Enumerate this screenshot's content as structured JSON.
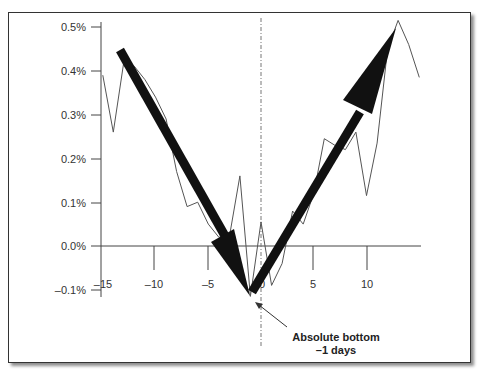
{
  "chart_data": {
    "type": "line",
    "title": "",
    "xlabel": "",
    "ylabel": "",
    "x": [
      -15,
      -14,
      -13,
      -12,
      -11,
      -10,
      -9,
      -8,
      -7,
      -6,
      -5,
      -4,
      -3,
      -2,
      -1,
      0,
      1,
      2,
      3,
      4,
      5,
      6,
      7,
      8,
      9,
      10,
      11,
      12,
      13,
      14,
      15
    ],
    "series": [
      {
        "name": "Return",
        "values": [
          0.39,
          0.26,
          0.42,
          0.41,
          0.38,
          0.34,
          0.29,
          0.17,
          0.09,
          0.1,
          0.05,
          0.02,
          0.02,
          0.16,
          -0.115,
          0.055,
          -0.09,
          -0.04,
          0.08,
          0.05,
          0.12,
          0.245,
          0.23,
          0.22,
          0.26,
          0.115,
          0.235,
          0.45,
          0.515,
          0.46,
          0.385
        ]
      }
    ],
    "xticks": [
      "-15",
      "-10",
      "-5",
      "0",
      "5",
      "10"
    ],
    "yticks": [
      "0.5%",
      "0.4%",
      "0.3%",
      "0.2%",
      "0.1%",
      "0.0%",
      "-0.1%"
    ],
    "ylim": [
      -0.1,
      0.5
    ],
    "xlim": [
      -15,
      15
    ],
    "grid": false,
    "legend": "none",
    "annotations": [
      {
        "text": "Absolute bottom",
        "line2": "–1 days",
        "x": -1,
        "y": -0.115
      },
      {
        "type": "trend-arrow",
        "from": [
          -13.5,
          0.455
        ],
        "to": [
          -1,
          -0.115
        ]
      },
      {
        "type": "trend-arrow",
        "from": [
          -1,
          -0.115
        ],
        "to": [
          12.5,
          0.5
        ]
      },
      {
        "type": "vertical-dashed-line",
        "x": 0
      }
    ]
  },
  "labels": {
    "y": [
      "0.5%",
      "0.4%",
      "0.3%",
      "0.2%",
      "0.1%",
      "0.0%",
      "–0.1%"
    ],
    "x": [
      "–15",
      "–10",
      "–5",
      "0",
      "5",
      "10"
    ],
    "annot_line1": "Absolute bottom",
    "annot_line2": "–1 days"
  }
}
